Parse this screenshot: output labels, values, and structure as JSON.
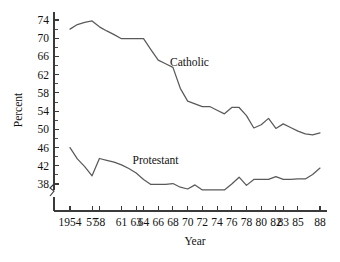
{
  "chart_data": {
    "type": "line",
    "title": "",
    "xlabel": "Year",
    "ylabel": "Percent",
    "grid": false,
    "legend_position": "inline-annotation",
    "xlim": [
      1954,
      1988
    ],
    "ylim": [
      36,
      75
    ],
    "y_axis_break": true,
    "y_axis_break_note": "axis broken below 38",
    "ytick_labels": [
      "74",
      "70",
      "66",
      "62",
      "58",
      "54",
      "50",
      "46",
      "42",
      "38"
    ],
    "ytick_values": [
      74,
      70,
      66,
      62,
      58,
      54,
      50,
      46,
      42,
      38
    ],
    "yminor_step": 2,
    "xtick_labels": [
      "1954",
      "57",
      "58",
      "61",
      "63",
      "64",
      "66",
      "68",
      "70",
      "72",
      "74",
      "76",
      "78",
      "80",
      "82",
      "83",
      "85",
      "88"
    ],
    "xtick_values": [
      1954,
      1957,
      1958,
      1961,
      1963,
      1964,
      1966,
      1968,
      1970,
      1972,
      1974,
      1976,
      1978,
      1980,
      1982,
      1983,
      1985,
      1988
    ],
    "x": [
      1954,
      1955,
      1956,
      1957,
      1958,
      1959,
      1960,
      1961,
      1962,
      1963,
      1964,
      1965,
      1966,
      1967,
      1968,
      1969,
      1970,
      1971,
      1972,
      1973,
      1974,
      1975,
      1976,
      1977,
      1978,
      1979,
      1980,
      1981,
      1982,
      1983,
      1984,
      1985,
      1986,
      1987,
      1988
    ],
    "series": [
      {
        "name": "Catholic",
        "label": "Catholic",
        "color": "#5a5a5a",
        "values": [
          72.0,
          73.0,
          73.5,
          73.8,
          72.5,
          71.6,
          70.8,
          69.9,
          69.9,
          69.9,
          69.9,
          67.5,
          65.2,
          64.4,
          63.6,
          59.0,
          56.2,
          55.6,
          55.0,
          55.0,
          54.2,
          53.4,
          54.8,
          54.8,
          53.0,
          50.3,
          51.0,
          52.4,
          50.2,
          51.2,
          50.4,
          49.6,
          49.0,
          48.8,
          49.2
        ]
      },
      {
        "name": "Protestant",
        "label": "Protestant",
        "color": "#5a5a5a",
        "values": [
          46.0,
          43.5,
          41.8,
          39.8,
          43.6,
          43.2,
          42.8,
          42.2,
          41.4,
          40.4,
          39.0,
          37.9,
          37.9,
          37.9,
          38.1,
          37.3,
          36.9,
          37.8,
          36.7,
          36.7,
          36.7,
          36.7,
          38.0,
          39.5,
          37.7,
          39.0,
          39.0,
          39.0,
          39.6,
          39.0,
          39.0,
          39.1,
          39.1,
          40.1,
          41.5
        ]
      }
    ],
    "annotations": [
      {
        "text": "Catholic",
        "x": 1967.6,
        "y": 64.0
      },
      {
        "text": "Protestant",
        "x": 1962.5,
        "y": 42.4
      }
    ]
  },
  "axes": {
    "y_title": "Percent",
    "x_title": "Year"
  }
}
